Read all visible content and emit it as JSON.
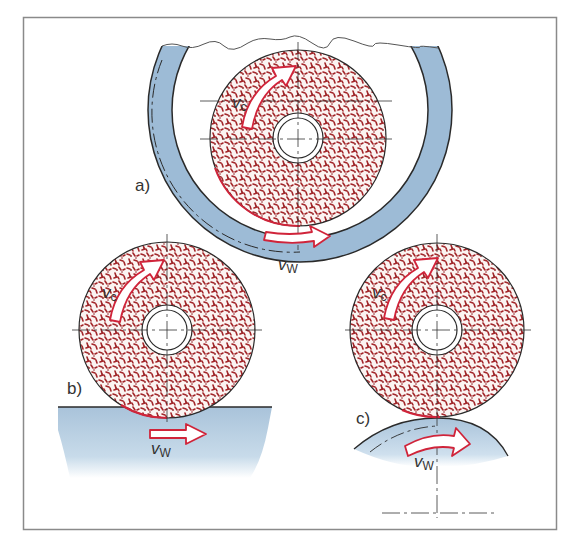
{
  "figure": {
    "frame_color": "#8a8a8a",
    "colors": {
      "workpiece_blue": "#9dbbd6",
      "workpiece_blue_light": "#dde9f3",
      "wheel_grain": "#a3262a",
      "arrow_outline": "#d0243a",
      "outline": "#2a2a2a"
    },
    "panels": [
      {
        "id": "a",
        "label": "a)",
        "type": "internal-grinding",
        "wheel_speed_label": {
          "symbol": "v",
          "subscript": "c"
        },
        "workpiece_speed_label": {
          "symbol": "v",
          "subscript": "W"
        }
      },
      {
        "id": "b",
        "label": "b)",
        "type": "surface-grinding",
        "wheel_speed_label": {
          "symbol": "v",
          "subscript": "c"
        },
        "workpiece_speed_label": {
          "symbol": "v",
          "subscript": "W"
        }
      },
      {
        "id": "c",
        "label": "c)",
        "type": "external-cylindrical-grinding",
        "wheel_speed_label": {
          "symbol": "v",
          "subscript": "c"
        },
        "workpiece_speed_label": {
          "symbol": "v",
          "subscript": "W"
        }
      }
    ]
  }
}
